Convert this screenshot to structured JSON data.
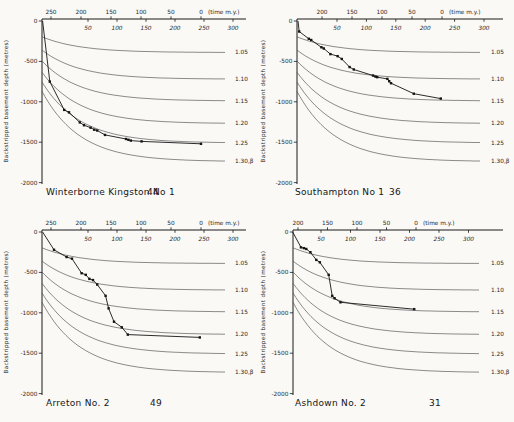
{
  "chart_data": [
    {
      "type": "line",
      "well": "Winterborne Kingston No 1",
      "count": "44",
      "xlabel_top": "(time m.y.)",
      "ylabel": "Backstripped basement depth (metres)",
      "time_ticks": [
        250,
        200,
        150,
        100,
        50,
        0
      ],
      "elapsed_ticks": [
        50,
        100,
        150,
        200,
        250,
        300
      ],
      "depth_ticks": [
        0,
        -500,
        -1000,
        -1500,
        -2000
      ],
      "ylim": [
        0,
        -2000
      ],
      "curves": {
        "labels": [
          "1.05",
          "1.10",
          "1.15",
          "1.20",
          "1.25",
          "1.30,β"
        ],
        "asymptote_depth_m": [
          -390,
          -720,
          -990,
          -1270,
          -1510,
          -1740
        ],
        "initial_fraction": 0.5,
        "tau_my": 62.8
      },
      "series_start": [
        264,
        0
      ],
      "series_points": [
        [
          252,
          -750
        ],
        [
          228,
          -1100
        ],
        [
          220,
          -1130
        ],
        [
          202,
          -1255
        ],
        [
          195,
          -1290
        ],
        [
          184,
          -1320
        ],
        [
          178,
          -1345
        ],
        [
          173,
          -1355
        ],
        [
          160,
          -1410
        ],
        [
          125,
          -1460
        ],
        [
          121,
          -1470
        ],
        [
          117,
          -1480
        ],
        [
          99,
          -1490
        ],
        [
          0,
          -1520
        ]
      ],
      "layout": {
        "axis_x": 42,
        "first_tick_value": 250,
        "first_tick_x": 51,
        "px_per_my": 0.6,
        "elapsed_first_x": 88,
        "elapsed_spacing": 29,
        "depth0_y": 21,
        "px_per_m": 0.0808,
        "curve_end_x": 225,
        "label_x": 235,
        "axis_end_x": 246,
        "caption_name_x": 46,
        "caption_count_x": 147
      }
    },
    {
      "type": "line",
      "well": "Southampton No 1",
      "count": "36",
      "xlabel_top": "(time m.y.)",
      "ylabel": "Backstripped basement depth (metres)",
      "time_ticks": [
        200,
        150,
        100,
        50,
        0
      ],
      "elapsed_ticks": [
        50,
        100,
        150,
        200,
        250,
        300
      ],
      "depth_ticks": [
        0,
        -500,
        -1000,
        -1500,
        -2000
      ],
      "ylim": [
        0,
        -2000
      ],
      "curves": {
        "labels": [
          "1.05",
          "1.10",
          "1.15",
          "1.20",
          "1.25",
          "1.30,β"
        ],
        "asymptote_depth_m": [
          -390,
          -720,
          -990,
          -1270,
          -1510,
          -1740
        ],
        "initial_fraction": 0.5,
        "tau_my": 62.8
      },
      "series_start": [
        240,
        0
      ],
      "series_points": [
        [
          238,
          -130
        ],
        [
          222,
          -220
        ],
        [
          218,
          -235
        ],
        [
          201,
          -325
        ],
        [
          197,
          -340
        ],
        [
          186,
          -410
        ],
        [
          174,
          -435
        ],
        [
          167,
          -470
        ],
        [
          154,
          -570
        ],
        [
          147,
          -600
        ],
        [
          115,
          -675
        ],
        [
          111,
          -688
        ],
        [
          108,
          -695
        ],
        [
          91,
          -716
        ],
        [
          88,
          -745
        ],
        [
          85,
          -770
        ],
        [
          47,
          -900
        ],
        [
          2,
          -960
        ]
      ],
      "layout": {
        "axis_x": 40,
        "first_tick_value": 200,
        "first_tick_x": 65,
        "px_per_my": 0.6,
        "elapsed_first_x": 80,
        "elapsed_spacing": 29.4,
        "depth0_y": 21,
        "px_per_m": 0.0808,
        "curve_end_x": 224,
        "label_x": 234,
        "axis_end_x": 246,
        "caption_name_x": 38,
        "caption_count_x": 132
      }
    },
    {
      "type": "line",
      "well": "Arreton No. 2",
      "count": "49",
      "xlabel_top": "(time m.y.)",
      "ylabel": "Backstripped basement depth (metres)",
      "time_ticks": [
        250,
        200,
        150,
        100,
        50,
        0
      ],
      "elapsed_ticks": [
        50,
        100,
        150,
        200,
        250,
        300
      ],
      "depth_ticks": [
        0,
        -500,
        -1000,
        -1500,
        -2000
      ],
      "ylim": [
        0,
        -2000
      ],
      "curves": {
        "labels": [
          "1.05",
          "1.10",
          "1.15",
          "1.20",
          "1.25",
          "1.30,β"
        ],
        "asymptote_depth_m": [
          -390,
          -720,
          -990,
          -1270,
          -1510,
          -1740
        ],
        "initial_fraction": 0.5,
        "tau_my": 62.8
      },
      "series_start": [
        264,
        0
      ],
      "series_points": [
        [
          245,
          -220
        ],
        [
          224,
          -310
        ],
        [
          215,
          -330
        ],
        [
          199,
          -510
        ],
        [
          192,
          -530
        ],
        [
          186,
          -580
        ],
        [
          180,
          -595
        ],
        [
          173,
          -650
        ],
        [
          159,
          -790
        ],
        [
          154,
          -945
        ],
        [
          145,
          -1110
        ],
        [
          132,
          -1180
        ],
        [
          122,
          -1270
        ],
        [
          2,
          -1305
        ]
      ],
      "layout": {
        "axis_x": 42,
        "first_tick_value": 250,
        "first_tick_x": 51,
        "px_per_my": 0.6,
        "elapsed_first_x": 88,
        "elapsed_spacing": 29,
        "depth0_y": 21,
        "px_per_m": 0.0808,
        "curve_end_x": 225,
        "label_x": 235,
        "axis_end_x": 246,
        "caption_name_x": 46,
        "caption_count_x": 150
      }
    },
    {
      "type": "line",
      "well": "Ashdown No. 2",
      "count": "31",
      "xlabel_top": "(time m.y.)",
      "ylabel": "Backstripped basement depth (metres)",
      "time_ticks": [
        200,
        150,
        100,
        50,
        0
      ],
      "elapsed_ticks": [
        50,
        100,
        150,
        200,
        250,
        300
      ],
      "depth_ticks": [
        0,
        -500,
        -1000,
        -1500,
        -2000
      ],
      "ylim": [
        0,
        -2000
      ],
      "curves": {
        "labels": [
          "1.05",
          "1.10",
          "1.15",
          "1.20",
          "1.25",
          "1.30,β"
        ],
        "asymptote_depth_m": [
          -390,
          -720,
          -990,
          -1270,
          -1510,
          -1740
        ],
        "initial_fraction": 0.5,
        "tau_my": 62.8
      },
      "series_start": [
        209,
        0
      ],
      "series_points": [
        [
          195,
          -190
        ],
        [
          190,
          -200
        ],
        [
          186,
          -210
        ],
        [
          179,
          -250
        ],
        [
          169,
          -345
        ],
        [
          163,
          -375
        ],
        [
          148,
          -530
        ],
        [
          142,
          -790
        ],
        [
          138,
          -820
        ],
        [
          128,
          -870
        ],
        [
          3,
          -955
        ]
      ],
      "layout": {
        "axis_x": 36,
        "first_tick_value": 200,
        "first_tick_x": 41,
        "px_per_my": 0.59,
        "elapsed_first_x": 64,
        "elapsed_spacing": 29.5,
        "depth0_y": 21,
        "px_per_m": 0.0808,
        "curve_end_x": 224,
        "label_x": 234,
        "axis_end_x": 246,
        "caption_name_x": 38,
        "caption_count_x": 172
      }
    }
  ]
}
